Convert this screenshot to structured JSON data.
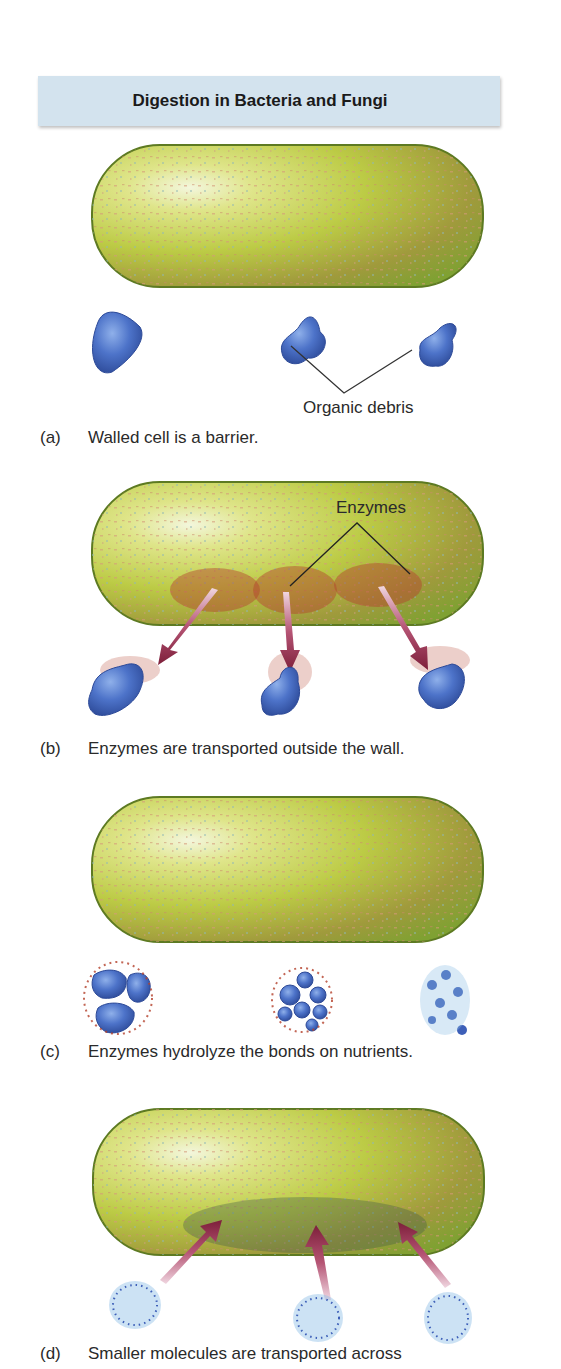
{
  "title": "Digestion in Bacteria and Fungi",
  "panels": [
    {
      "id": "a",
      "letter": "(a)",
      "caption": "Walled cell is a barrier.",
      "callout": "Organic debris"
    },
    {
      "id": "b",
      "letter": "(b)",
      "caption": "Enzymes are transported outside the wall.",
      "callout": "Enzymes"
    },
    {
      "id": "c",
      "letter": "(c)",
      "caption": "Enzymes hydrolyze the bonds on nutrients."
    },
    {
      "id": "d",
      "letter": "(d)",
      "caption": "Smaller molecules are transported across"
    }
  ],
  "colors": {
    "cell_green": "#a8c13a",
    "cell_outline": "#5d7a22",
    "debris_blue": "#4a6fc4",
    "enzyme_red": "#b4412c",
    "arrow_maroon": "#8e2a45",
    "title_bg": "#d3e3ee"
  }
}
